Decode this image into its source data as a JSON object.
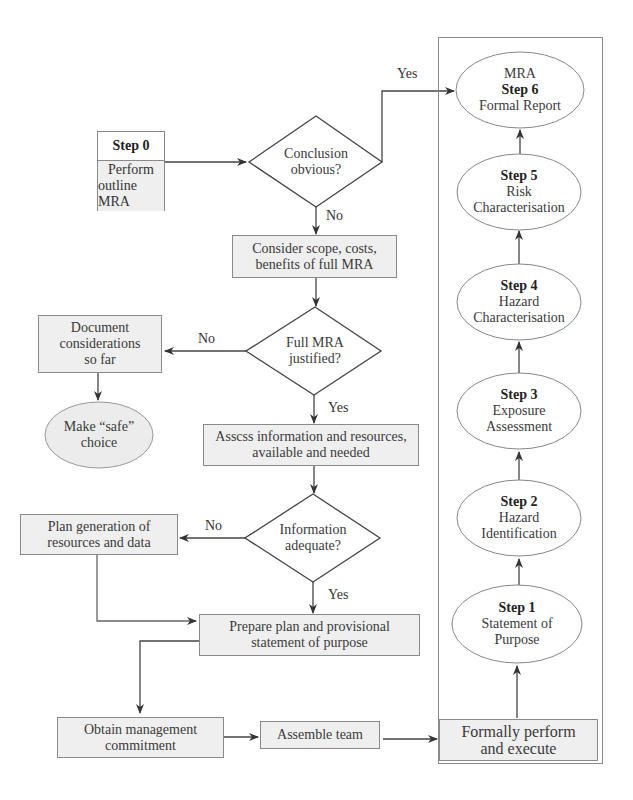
{
  "diagram": {
    "step0": {
      "title": "Step 0",
      "line1": "Perform",
      "line2": "outline MRA"
    },
    "conclusion": {
      "line1": "Conclusion",
      "line2": "obvious?"
    },
    "consider": {
      "line1": "Consider scope, costs,",
      "line2": "benefits of full MRA"
    },
    "justified": {
      "line1": "Full MRA",
      "line2": "justified?"
    },
    "document": {
      "line1": "Document",
      "line2": "considerations",
      "line3": "so far"
    },
    "safe": {
      "line1": "Make “safe”",
      "line2": "choice"
    },
    "assess": {
      "line1": "Asscss information and resources,",
      "line2": "available and needed"
    },
    "information": {
      "line1": "Information",
      "line2": "adequate?"
    },
    "plangen": {
      "line1": "Plan generation of",
      "line2": "resources and data"
    },
    "prepare": {
      "line1": "Prepare plan and provisional",
      "line2": "statement of purpose"
    },
    "obtain": {
      "line1": "Obtain management",
      "line2": "commitment"
    },
    "assemble": {
      "line1": "Assemble team"
    },
    "formally": {
      "line1": "Formally perform",
      "line2": "and execute"
    },
    "steps": [
      {
        "title": "Step 1",
        "line1": "Statement of",
        "line2": "Purpose"
      },
      {
        "title": "Step 2",
        "line1": "Hazard",
        "line2": "Identification"
      },
      {
        "title": "Step 3",
        "line1": "Exposure",
        "line2": "Assessment"
      },
      {
        "title": "Step 4",
        "line1": "Hazard",
        "line2": "Characterisation"
      },
      {
        "title": "Step 5",
        "line1": "Risk",
        "line2": "Characterisation"
      },
      {
        "pre": "MRA",
        "title": "Step 6",
        "line1": "Formal Report"
      }
    ],
    "labels": {
      "yes_conclusion": "Yes",
      "no_conclusion": "No",
      "no_justified": "No",
      "yes_justified": "Yes",
      "no_information": "No",
      "yes_information": "Yes"
    }
  }
}
